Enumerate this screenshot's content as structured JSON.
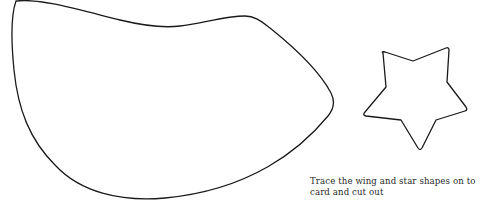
{
  "caption": {
    "line1": "Trace the wing and star shapes on to",
    "line2": "card and cut out"
  },
  "shapes": [
    {
      "name": "wing",
      "type": "outline"
    },
    {
      "name": "star",
      "type": "outline",
      "points": 5
    }
  ],
  "colors": {
    "background": "#ffffff",
    "outline": "#1a1a1a",
    "text": "#2a2a2a"
  }
}
